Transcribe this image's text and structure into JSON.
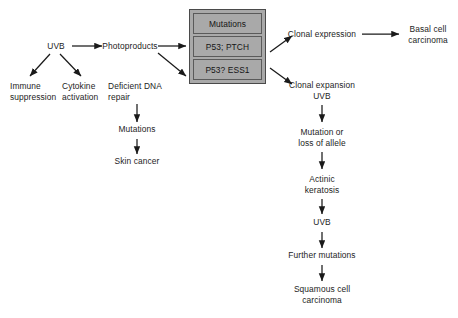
{
  "diagram": {
    "background_color": "#ffffff",
    "text_color": "#1d1d1d",
    "box_fill_color": "#a9a9a9",
    "box_border_color": "#4a4a4a"
  },
  "nodes": {
    "uvb_source": "UVB",
    "photoproducts": "Photoproducts",
    "immune_suppression": "Immune\nsuppression",
    "cytokine_activation": "Cytokine\nactivation",
    "deficient_dna_repair": "Deficient DNA\nrepair",
    "mutations_left": "Mutations",
    "skin_cancer": "Skin cancer",
    "clonal_expression": "Clonal expression",
    "basal_cell_carcinoma": "Basal cell\ncarcinoma",
    "clonal_expansion_uvb": "Clonal expansion\nUVB",
    "mutation_or_loss_of_allele": "Mutation or\nloss of allele",
    "actinic_keratosis": "Actinic\nkeratosis",
    "uvb_second": "UVB",
    "further_mutations": "Further mutations",
    "squamous_cell_carcinoma": "Squamous cell\ncarcinoma"
  },
  "mutation_box": {
    "header": "Mutations",
    "rows": [
      "P53; PTCH",
      "P53? ESS1"
    ]
  }
}
